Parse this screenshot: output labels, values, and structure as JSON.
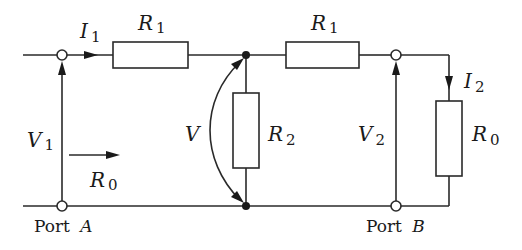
{
  "diagram": {
    "type": "circuit",
    "title": "",
    "components": [
      {
        "id": "R1_left",
        "symbol": "R",
        "subscript": "1"
      },
      {
        "id": "R1_right",
        "symbol": "R",
        "subscript": "1"
      },
      {
        "id": "R2",
        "symbol": "R",
        "subscript": "2"
      },
      {
        "id": "R0_load",
        "symbol": "R",
        "subscript": "0"
      }
    ],
    "labels": {
      "i1": {
        "symbol": "I",
        "subscript": "1"
      },
      "i2": {
        "symbol": "I",
        "subscript": "2"
      },
      "v1": {
        "symbol": "V",
        "subscript": "1"
      },
      "v2": {
        "symbol": "V",
        "subscript": "2"
      },
      "v": {
        "symbol": "V"
      },
      "r0_input": {
        "symbol": "R",
        "subscript": "0"
      },
      "r1_left": {
        "symbol": "R",
        "subscript": "1"
      },
      "r1_right": {
        "symbol": "R",
        "subscript": "1"
      },
      "r2": {
        "symbol": "R",
        "subscript": "2"
      },
      "r0_load": {
        "symbol": "R",
        "subscript": "0"
      }
    },
    "ports": {
      "a": {
        "prefix": "Port ",
        "name": "A"
      },
      "b": {
        "prefix": "Port ",
        "name": "B"
      }
    },
    "colors": {
      "line": "#2a2a2a",
      "background": "#ffffff"
    }
  }
}
